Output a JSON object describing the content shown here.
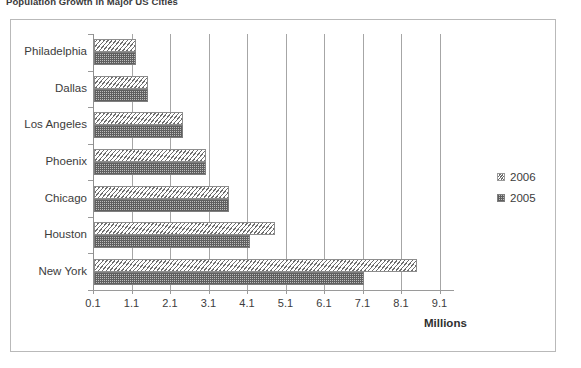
{
  "chart_data": {
    "type": "bar",
    "orientation": "horizontal",
    "title": "Population Growth in Major US Cities",
    "xlabel": "Millions",
    "ylabel": "",
    "categories": [
      "Philadelphia",
      "Dallas",
      "Los Angeles",
      "Phoenix",
      "Chicago",
      "Houston",
      "New York"
    ],
    "series": [
      {
        "name": "2006",
        "values": [
          1.2,
          1.5,
          2.4,
          3.0,
          3.6,
          4.8,
          8.5
        ]
      },
      {
        "name": "2005",
        "values": [
          1.2,
          1.5,
          2.4,
          3.0,
          3.6,
          4.15,
          7.1
        ]
      }
    ],
    "xlim": [
      0.1,
      9.6
    ],
    "xticks": [
      "0.1",
      "1.1",
      "2.1",
      "3.1",
      "4.1",
      "5.1",
      "6.1",
      "7.1",
      "8.1",
      "9.1"
    ],
    "xtick_values": [
      0.1,
      1.1,
      2.1,
      3.1,
      4.1,
      5.1,
      6.1,
      7.1,
      8.1,
      9.1
    ],
    "grid": "vertical",
    "legend_position": "right"
  },
  "legend": {
    "entries": [
      {
        "label": "2006",
        "swatch": "diagonal-hatch-swatch"
      },
      {
        "label": "2005",
        "swatch": "checker-fill-swatch"
      }
    ]
  },
  "colors": {
    "series_2006_line": "#6e6e6e",
    "series_2005_fill": "#bdbdbd",
    "gridline": "#a6a6a6",
    "frame_border": "#b9b9b9",
    "text": "#3c3c3c",
    "background": "#ffffff"
  }
}
